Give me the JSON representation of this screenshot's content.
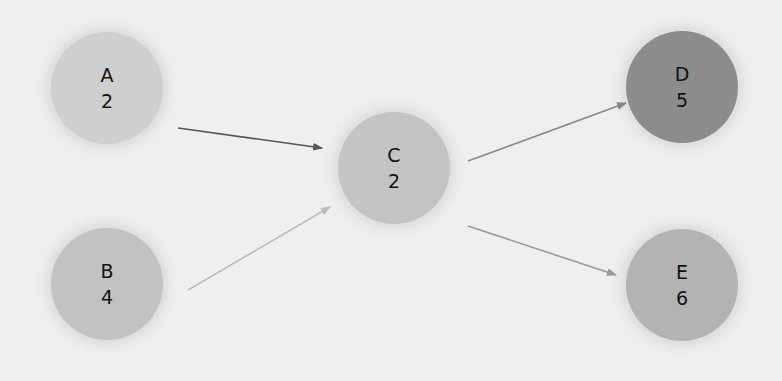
{
  "diagram": {
    "type": "directed-graph",
    "nodes": [
      {
        "id": "A",
        "label": "A",
        "value": "2",
        "cx": 107,
        "cy": 88,
        "color": "#cfcfcf"
      },
      {
        "id": "B",
        "label": "B",
        "value": "4",
        "cx": 107,
        "cy": 284,
        "color": "#c2c2c2"
      },
      {
        "id": "C",
        "label": "C",
        "value": "2",
        "cx": 394,
        "cy": 168,
        "color": "#c4c4c4"
      },
      {
        "id": "D",
        "label": "D",
        "value": "5",
        "cx": 682,
        "cy": 87,
        "color": "#8c8c8c"
      },
      {
        "id": "E",
        "label": "E",
        "value": "6",
        "cx": 682,
        "cy": 285,
        "color": "#b3b3b3"
      }
    ],
    "edges": [
      {
        "from": "A",
        "to": "C",
        "x1": 178,
        "y1": 128,
        "x2": 322,
        "y2": 148,
        "color": "#555555"
      },
      {
        "from": "B",
        "to": "C",
        "x1": 188,
        "y1": 290,
        "x2": 330,
        "y2": 207,
        "color": "#bbbbbb"
      },
      {
        "from": "C",
        "to": "D",
        "x1": 468,
        "y1": 161,
        "x2": 626,
        "y2": 103,
        "color": "#888888"
      },
      {
        "from": "C",
        "to": "E",
        "x1": 468,
        "y1": 226,
        "x2": 616,
        "y2": 275,
        "color": "#999999"
      }
    ]
  }
}
